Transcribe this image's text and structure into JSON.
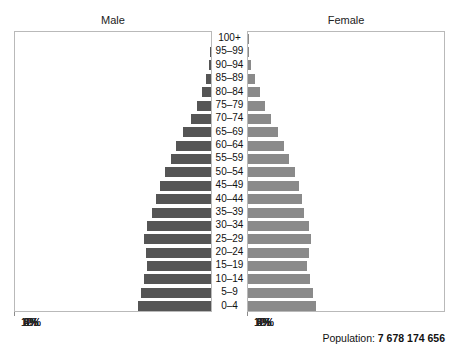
{
  "panels": {
    "male_title": "Male",
    "female_title": "Female"
  },
  "footer": {
    "population_label": "Population:",
    "population_value": "7 678 174 656"
  },
  "axis": {
    "tick_labels_male": [
      "12%",
      "10%",
      "8%",
      "6%",
      "4%",
      "2%",
      "0%"
    ],
    "tick_labels_female": [
      "0%",
      "2%",
      "4%",
      "6%",
      "8%",
      "10%",
      "12%"
    ],
    "max_percent": 12,
    "tick_step": 2
  },
  "chart_data": {
    "type": "bar",
    "subtype": "population-pyramid",
    "title": "",
    "xlabel": "",
    "ylabel": "",
    "xlim": [
      0,
      12
    ],
    "grid": true,
    "legend_position": "top",
    "orientation": "horizontal-mirrored",
    "categories": [
      "100+",
      "95–99",
      "90–94",
      "85–89",
      "80–84",
      "75–79",
      "70–74",
      "65–69",
      "60–64",
      "55–59",
      "50–54",
      "45–49",
      "40–44",
      "35–39",
      "30–34",
      "25–29",
      "20–24",
      "15–19",
      "10–14",
      "5–9",
      "0–4"
    ],
    "unit": "percent of total population",
    "series": [
      {
        "name": "Male",
        "color": "#555555",
        "side": "left",
        "values": [
          0.01,
          0.04,
          0.12,
          0.28,
          0.52,
          0.82,
          1.22,
          1.68,
          2.1,
          2.45,
          2.8,
          3.1,
          3.35,
          3.55,
          3.9,
          4.05,
          3.95,
          3.85,
          4.05,
          4.25,
          4.4
        ]
      },
      {
        "name": "Female",
        "color": "#8a8a8a",
        "side": "right",
        "values": [
          0.02,
          0.07,
          0.19,
          0.4,
          0.7,
          1.0,
          1.38,
          1.8,
          2.18,
          2.5,
          2.82,
          3.08,
          3.28,
          3.42,
          3.7,
          3.82,
          3.7,
          3.58,
          3.78,
          3.95,
          4.1
        ]
      }
    ]
  }
}
